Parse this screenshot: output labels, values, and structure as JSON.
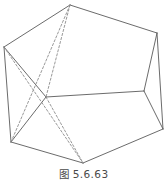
{
  "figure": {
    "caption": "图 5.6.63",
    "caption_label": "figure-number",
    "stroke_color": "#5a5a5a",
    "dashed_stroke_color": "#8c8c8c",
    "background_color": "#ffffff",
    "stroke_width": 0.9,
    "dash_pattern": "2.2 2.0",
    "view_box": "0 0 167 187",
    "diagram_type": "3d-polyhedron-wireframe",
    "vertices": [
      {
        "id": "top",
        "name": "apex-vertex",
        "x": 70,
        "y": 5
      },
      {
        "id": "left",
        "name": "left-vertex",
        "x": 4,
        "y": 47
      },
      {
        "id": "right_upper",
        "name": "right-upper-vertex",
        "x": 157,
        "y": 33
      },
      {
        "id": "center",
        "name": "interior-vertex",
        "x": 46,
        "y": 97
      },
      {
        "id": "right_middle",
        "name": "right-middle-vertex",
        "x": 144,
        "y": 91
      },
      {
        "id": "bottom_left",
        "name": "bottom-left-vertex",
        "x": 11,
        "y": 142
      },
      {
        "id": "bottom",
        "name": "bottom-vertex",
        "x": 83,
        "y": 163
      },
      {
        "id": "bottom_right",
        "name": "bottom-right-vertex",
        "x": 163,
        "y": 129
      }
    ],
    "solid_edges": [
      {
        "name": "edge-top-left",
        "from": "top",
        "to": "left"
      },
      {
        "name": "edge-top-right-upper",
        "from": "top",
        "to": "right_upper"
      },
      {
        "name": "edge-left-center",
        "from": "left",
        "to": "center"
      },
      {
        "name": "edge-center-right-middle",
        "from": "center",
        "to": "right_middle"
      },
      {
        "name": "edge-right-upper-right-middle",
        "from": "right_upper",
        "to": "right_middle"
      },
      {
        "name": "edge-left-bottom-left",
        "from": "left",
        "to": "bottom_left"
      },
      {
        "name": "edge-right-middle-bottom-right",
        "from": "right_middle",
        "to": "bottom_right"
      },
      {
        "name": "edge-right-upper-bottom-right",
        "from": "right_upper",
        "to": "bottom_right"
      },
      {
        "name": "edge-bottom-left-bottom",
        "from": "bottom_left",
        "to": "bottom"
      },
      {
        "name": "edge-bottom-bottom-right",
        "from": "bottom",
        "to": "bottom_right"
      },
      {
        "name": "edge-center-bottom-left",
        "from": "center",
        "to": "bottom_left"
      }
    ],
    "dashed_edges": [
      {
        "name": "hidden-edge-top-center",
        "from": "top",
        "to": "center"
      },
      {
        "name": "hidden-edge-left-bottom",
        "from": "left",
        "to": "bottom"
      },
      {
        "name": "hidden-edge-bottom-left-top",
        "from": "bottom_left",
        "to": "top"
      },
      {
        "name": "hidden-edge-center-bottom",
        "from": "center",
        "to": "bottom"
      }
    ]
  }
}
